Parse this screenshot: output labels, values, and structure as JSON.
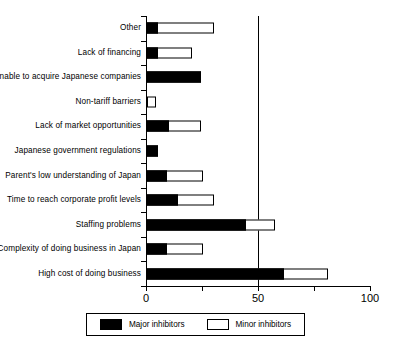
{
  "chart_data": {
    "type": "bar",
    "orientation": "horizontal",
    "stacked": true,
    "title": "",
    "xlabel": "",
    "ylabel": "",
    "xlim": [
      0,
      100
    ],
    "xticks": [
      0,
      50,
      100
    ],
    "xtick_labels": [
      "0",
      "50",
      "100"
    ],
    "grid": false,
    "gridlines_x": [
      50
    ],
    "legend_position": "bottom",
    "categories": [
      "Other",
      "Lack of financing",
      "Unable to acquire Japanese companies",
      "Non-tariff barriers",
      "Lack of market opportunities",
      "Japanese government regulations",
      "Parent's low understanding of Japan",
      "Time to reach corporate profit levels",
      "Staffing problems",
      "Complexity of doing business in Japan",
      "High cost of doing business"
    ],
    "series": [
      {
        "name": "Major inhibitors",
        "color": "#000000",
        "values": [
          5,
          5,
          24,
          0,
          10,
          5,
          9,
          14,
          44,
          9,
          61
        ]
      },
      {
        "name": "Minor inhibitors",
        "color": "#ffffff",
        "values": [
          25,
          15,
          0,
          4,
          14,
          0,
          16,
          16,
          13,
          16,
          20
        ]
      }
    ],
    "totals": [
      30,
      20,
      24,
      4,
      24,
      5,
      25,
      30,
      57,
      25,
      81
    ]
  },
  "legend": {
    "entries": [
      {
        "label": "Major inhibitors",
        "swatch": "major"
      },
      {
        "label": "Minor inhibitors",
        "swatch": "minor"
      }
    ]
  }
}
